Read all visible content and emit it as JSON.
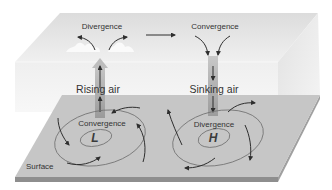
{
  "diagram": {
    "upper_level": {
      "left_label": "Divergence",
      "right_label": "Convergence"
    },
    "vertical_motion": {
      "left_label": "Rising air",
      "right_label": "Sinking air"
    },
    "surface": {
      "label": "Surface",
      "low": {
        "label": "Convergence",
        "symbol": "L"
      },
      "high": {
        "label": "Divergence",
        "symbol": "H"
      }
    },
    "colors": {
      "box_top": "#e6e6e6",
      "box_side": "#ececec",
      "surface_top": "#c8c8c8",
      "surface_edge": "#8a8a8a",
      "arrow": "#333333",
      "isobar": "#6e6e6e",
      "column": "#b0b0b0"
    }
  }
}
